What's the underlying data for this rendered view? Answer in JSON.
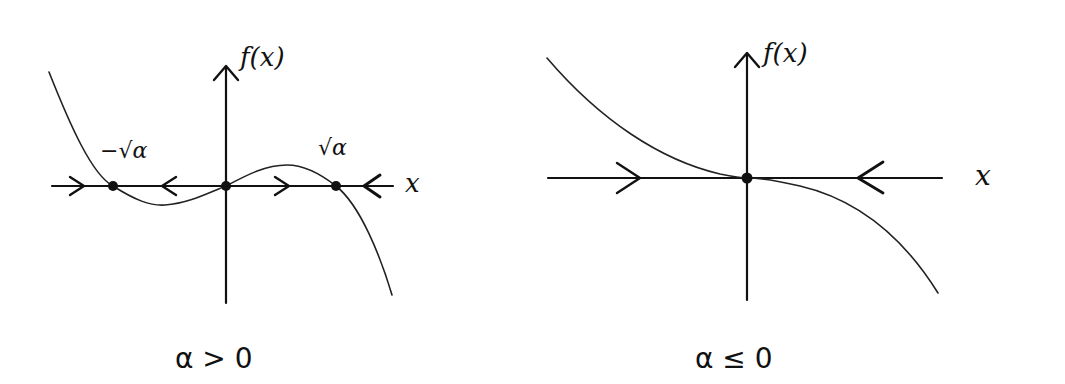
{
  "diagram": {
    "panels": [
      {
        "id": "alpha-positive",
        "y_axis_label": "f(x)",
        "x_axis_label": "x",
        "caption": "α > 0",
        "fixed_points": [
          {
            "label": "−√α",
            "x_pos": 113,
            "stability": "stable"
          },
          {
            "label": "",
            "x_pos": 226,
            "stability": "unstable"
          },
          {
            "label": "√α",
            "x_pos": 336,
            "stability": "stable"
          }
        ],
        "flow_arrows": [
          {
            "x": 77,
            "direction": "right"
          },
          {
            "x": 170,
            "direction": "left"
          },
          {
            "x": 285,
            "direction": "right"
          },
          {
            "x": 372,
            "direction": "left"
          }
        ]
      },
      {
        "id": "alpha-nonpositive",
        "y_axis_label": "f(x)",
        "x_axis_label": "x",
        "caption": "α ≤ 0",
        "fixed_points": [
          {
            "label": "",
            "x_pos": 747,
            "stability": "stable"
          }
        ],
        "flow_arrows": [
          {
            "x": 638,
            "direction": "right"
          },
          {
            "x": 868,
            "direction": "left"
          }
        ]
      }
    ]
  }
}
